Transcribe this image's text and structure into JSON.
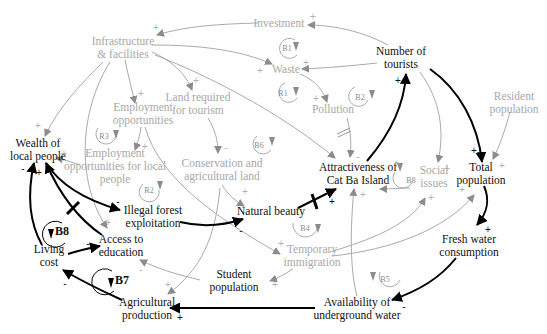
{
  "diagram": {
    "type": "causal-loop-diagram",
    "colors": {
      "primary": "#111111",
      "secondary": "#a8a8a8",
      "arrow_light": "#8c8c8c"
    },
    "nodes": {
      "investment": "Investment",
      "infrastructure": "Infrastructure\n& facilities",
      "number_of_tourists": "Number of\ntourists",
      "waste": "Waste",
      "pollution": "Pollution",
      "resident_population": "Resident\npopulation",
      "employment_opportunities": "Employment\nopportunities",
      "land_required": "Land required\nfor tourism",
      "wealth": "Wealth of\nlocal people",
      "employment_local": "Employment\nopportunities for local\npeople",
      "conservation": "Conservation and\nagricultural land",
      "attractiveness": "Attractiveness of\nCat Ba Island",
      "social_issues": "Social\nissues",
      "total_population": "Total\npopulation",
      "illegal_forest": "Illegal forest\nexploitation",
      "natural_beauty": "Natural beauty",
      "access_education": "Access to\neducation",
      "living_cost": "Living\ncost",
      "temporary_immigration": "Temporary\nimmigration",
      "fresh_water": "Fresh water\nconsumption",
      "student_population": "Student\npopulation",
      "availability_water": "Availability of\nunderground water",
      "agricultural_production": "Agricultural\nproduction"
    },
    "loops": {
      "B1": "B1",
      "R1": "R1",
      "B2": "B2",
      "R3": "R3",
      "B6": "B6",
      "R2": "R2",
      "B3": "B3",
      "B4": "B4",
      "B5": "B5",
      "B8": "B8",
      "B7": "B7"
    },
    "signs": {
      "plus": "+",
      "minus": "-"
    }
  }
}
